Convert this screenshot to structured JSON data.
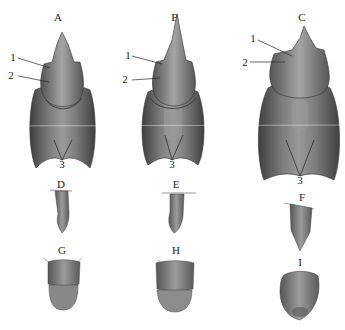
{
  "figure": {
    "panel_labels": {
      "A": "A",
      "B": "B",
      "C": "C",
      "D": "D",
      "E": "E",
      "F": "F",
      "G": "G",
      "H": "H",
      "I": "I"
    },
    "callouts": {
      "one": "1",
      "two": "2",
      "three": "3"
    },
    "colors": {
      "background": "#ffffff",
      "specimen_dark": "#4a4a4a",
      "specimen_mid": "#7a7a7a",
      "specimen_light": "#a8a8a8",
      "ink": "#222222"
    }
  }
}
